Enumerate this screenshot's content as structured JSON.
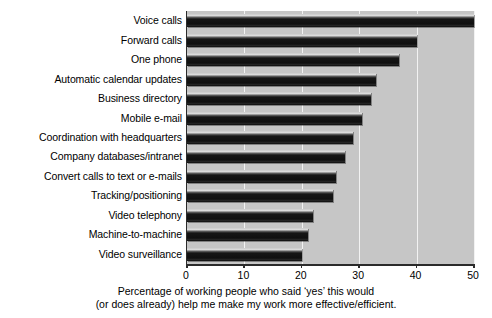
{
  "chart_data": {
    "type": "bar",
    "orientation": "horizontal",
    "title": "",
    "subtitle": "",
    "xlabel": "Percentage of working people who said 'yes' this would (or does already) help me make my work more effective/efficient.",
    "ylabel": "",
    "xlim": [
      0,
      50
    ],
    "xticks": [
      0,
      10,
      20,
      30,
      40,
      50
    ],
    "xticklabels": [
      "0",
      "10",
      "20",
      "30",
      "40",
      "50"
    ],
    "grid": "vertical",
    "legend": "none",
    "categories": [
      "Voice calls",
      "Forward calls",
      "One phone",
      "Automatic calendar updates",
      "Business directory",
      "Mobile e-mail",
      "Coordination with headquarters",
      "Company databases/intranet",
      "Convert calls to text or e-mails",
      "Tracking/positioning",
      "Video telephony",
      "Machine-to-machine",
      "Video surveillance"
    ],
    "values": [
      50,
      40,
      37,
      33,
      32,
      30.5,
      29,
      27.5,
      26,
      25.5,
      22,
      21,
      20
    ],
    "bar_color": "#1a1a1a",
    "plot_background": "#c6c6c6",
    "gridline_color": "#f2f2f2",
    "axis_color": "#2b2b2b"
  },
  "caption": {
    "line1": "Percentage of working people who said ‘yes’ this would",
    "line2": "(or does already) help me make my work more effective/efficient."
  }
}
